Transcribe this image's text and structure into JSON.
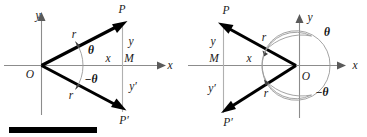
{
  "figure": {
    "background_color": "#ffffff",
    "ray_color": "#000000",
    "axis_color": "#8c8c8c",
    "arc_color": "#9a9a9a",
    "label_color": "#1a1a1a"
  },
  "left_panel": {
    "name": "right-opening-angle-diagram",
    "origin_label": "O",
    "axis_x_label": "x",
    "axis_y_label": "y",
    "point_p_label": "P",
    "point_p_prime_label": "P′",
    "foot_label": "M",
    "radius_label_upper": "r",
    "radius_label_lower": "r",
    "angle_label": "θ",
    "neg_angle_label": "−θ",
    "segment_x_label": "x",
    "segment_y_label": "y",
    "segment_y_prime_label": "y′"
  },
  "right_panel": {
    "name": "left-opening-angle-diagram",
    "origin_label": "O",
    "axis_x_label": "x",
    "axis_y_label": "y",
    "point_p_label": "P",
    "point_p_prime_label": "P′",
    "foot_label": "M",
    "radius_label_upper": "r",
    "radius_label_lower": "r",
    "angle_label": "θ",
    "neg_angle_label": "−θ",
    "segment_x_label": "x",
    "segment_y_label": "y",
    "segment_y_prime_label": "y′"
  },
  "scale_bar": {
    "name": "black-scale-bar",
    "color": "#000000"
  }
}
